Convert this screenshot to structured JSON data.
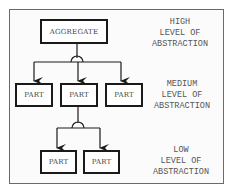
{
  "diagram": {
    "aggregate": {
      "label": "AGGREGATE"
    },
    "medium_parts": [
      {
        "label": "PART"
      },
      {
        "label": "PART"
      },
      {
        "label": "PART"
      }
    ],
    "low_parts": [
      {
        "label": "PART"
      },
      {
        "label": "PART"
      }
    ],
    "levels": {
      "high": {
        "line1": "HIGH",
        "line2": "LEVEL OF",
        "line3": "ABSTRACTION"
      },
      "medium": {
        "line1": "MEDIUM",
        "line2": "LEVEL OF",
        "line3": "ABSTRACTION"
      },
      "low": {
        "line1": "LOW",
        "line2": "LEVEL OF",
        "line3": "ABSTRACTION"
      }
    },
    "colors": {
      "line": "#1a1a1a",
      "frame": "#6a6a6a",
      "text": "#555555"
    }
  }
}
